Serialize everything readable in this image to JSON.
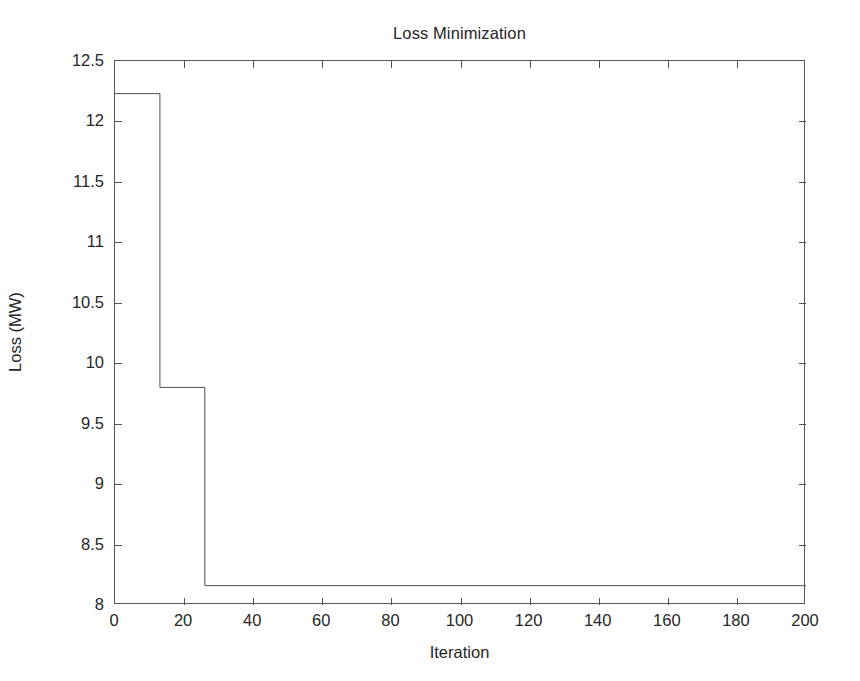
{
  "chart_data": {
    "type": "line",
    "title": "Loss Minimization",
    "xlabel": "Iteration",
    "ylabel": "Loss (MW)",
    "xlim": [
      0,
      200
    ],
    "ylim": [
      8,
      12.5
    ],
    "xticks": [
      0,
      20,
      40,
      60,
      80,
      100,
      120,
      140,
      160,
      180,
      200
    ],
    "yticks": [
      8,
      8.5,
      9,
      9.5,
      10,
      10.5,
      11,
      11.5,
      12,
      12.5
    ],
    "xtick_labels": [
      "0",
      "20",
      "40",
      "60",
      "80",
      "100",
      "120",
      "140",
      "160",
      "180",
      "200"
    ],
    "ytick_labels": [
      "8",
      "8.5",
      "9",
      "9.5",
      "10",
      "10.5",
      "11",
      "11.5",
      "12",
      "12.5"
    ],
    "grid": false,
    "legend": false,
    "line_style": "step-post",
    "line_color": "#4d4d4d",
    "line_width": 1,
    "series": [
      {
        "name": "Loss",
        "x": [
          0,
          13,
          13,
          26,
          26,
          200
        ],
        "y": [
          12.23,
          12.23,
          9.8,
          9.8,
          8.16,
          8.16
        ]
      }
    ],
    "steps": [
      {
        "from_iteration": 0,
        "to_iteration": 13,
        "loss": 12.23
      },
      {
        "from_iteration": 13,
        "to_iteration": 26,
        "loss": 9.8
      },
      {
        "from_iteration": 26,
        "to_iteration": 200,
        "loss": 8.16
      }
    ],
    "annotations": []
  },
  "figure": {
    "background_color": "#ffffff",
    "axes_color": "#555555",
    "text_color": "#262626"
  }
}
